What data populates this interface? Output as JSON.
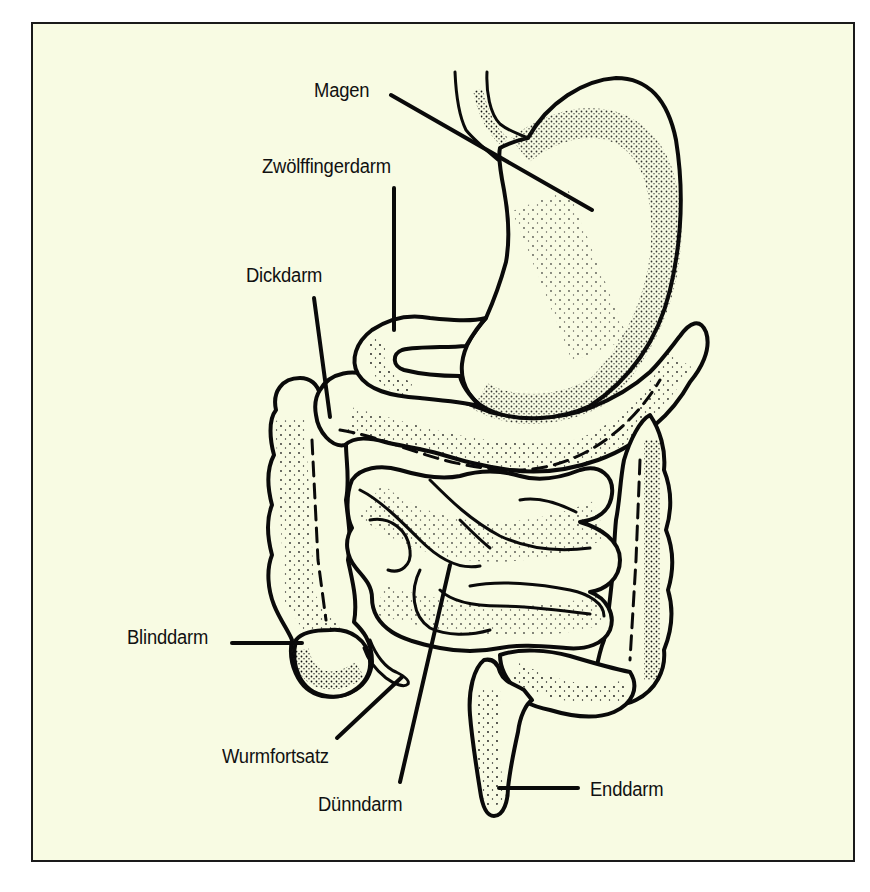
{
  "figure": {
    "background_color": "#f8fbe3",
    "border_color": "#1a1a1a"
  },
  "labels": {
    "magen": "Magen",
    "zwoelffingerdarm": "Zwölffingerdarm",
    "dickdarm": "Dickdarm",
    "blinddarm": "Blinddarm",
    "wurmfortsatz": "Wurmfortsatz",
    "duenndarm": "Dünndarm",
    "enddarm": "Enddarm"
  },
  "leaders": [
    {
      "label": "Magen",
      "from": [
        391,
        95
      ],
      "to": [
        592,
        210
      ]
    },
    {
      "label": "Zwölffingerdarm",
      "from": [
        394,
        188
      ],
      "to": [
        394,
        330
      ]
    },
    {
      "label": "Dickdarm",
      "from": [
        314,
        298
      ],
      "to": [
        330,
        417
      ]
    },
    {
      "label": "Blinddarm",
      "from": [
        232,
        643
      ],
      "to": [
        302,
        643
      ]
    },
    {
      "label": "Wurmfortsatz",
      "from": [
        337,
        738
      ],
      "to": [
        402,
        677
      ]
    },
    {
      "label": "Dünndarm",
      "from": [
        400,
        782
      ],
      "to": [
        450,
        565
      ]
    },
    {
      "label": "Enddarm",
      "from": [
        578,
        788
      ],
      "to": [
        499,
        788
      ]
    }
  ]
}
